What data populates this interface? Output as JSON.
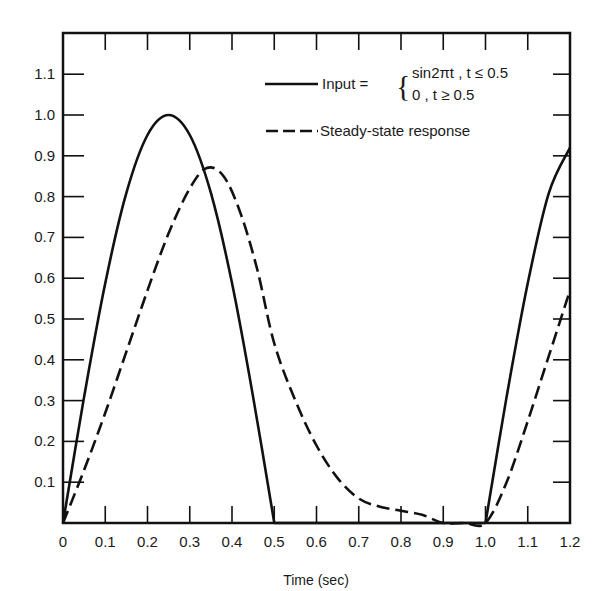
{
  "chart_data": {
    "type": "line",
    "title": "",
    "xlabel": "Time (sec)",
    "ylabel": "",
    "xlim": [
      0,
      1.2
    ],
    "ylim": [
      0,
      1.2
    ],
    "grid": false,
    "legend_position": "top-right",
    "x_ticks": [
      "0",
      "0.1",
      "0.2",
      "0.3",
      "0.4",
      "0.5",
      "0.6",
      "0.7",
      "0.8",
      "0.9",
      "1.0",
      "1.1",
      "1.2"
    ],
    "y_ticks": [
      "0.1",
      "0.2",
      "0.3",
      "0.4",
      "0.5",
      "0.6",
      "0.7",
      "0.8",
      "0.9",
      "1.0",
      "1.1"
    ],
    "series": [
      {
        "name": "Input",
        "style": "solid",
        "legend_label": "Input =",
        "legend_cases": [
          "sin2πt , t ≤ 0.5",
          "0 ,  t ≥ 0.5"
        ],
        "x": [
          0,
          0.05,
          0.1,
          0.15,
          0.2,
          0.25,
          0.3,
          0.35,
          0.4,
          0.45,
          0.5,
          0.5,
          0.6,
          0.7,
          0.8,
          0.9,
          1.0,
          1.0,
          1.05,
          1.1,
          1.15,
          1.2
        ],
        "values": [
          0,
          0.309,
          0.588,
          0.809,
          0.951,
          1.0,
          0.951,
          0.809,
          0.588,
          0.309,
          0,
          0,
          0,
          0,
          0,
          0,
          0,
          0,
          0.309,
          0.588,
          0.809,
          0.92
        ]
      },
      {
        "name": "Steady-state response",
        "style": "dashed",
        "legend_label": "Steady-state response",
        "x": [
          0,
          0.05,
          0.1,
          0.15,
          0.2,
          0.25,
          0.3,
          0.34,
          0.38,
          0.42,
          0.46,
          0.5,
          0.55,
          0.6,
          0.65,
          0.7,
          0.75,
          0.8,
          0.85,
          0.9,
          0.95,
          1.0,
          1.05,
          1.1,
          1.15,
          1.2
        ],
        "values": [
          0,
          0.13,
          0.27,
          0.42,
          0.57,
          0.71,
          0.82,
          0.87,
          0.85,
          0.76,
          0.62,
          0.44,
          0.3,
          0.19,
          0.11,
          0.06,
          0.04,
          0.03,
          0.02,
          0.0,
          0.0,
          0.0,
          0.1,
          0.25,
          0.41,
          0.57
        ]
      }
    ]
  }
}
